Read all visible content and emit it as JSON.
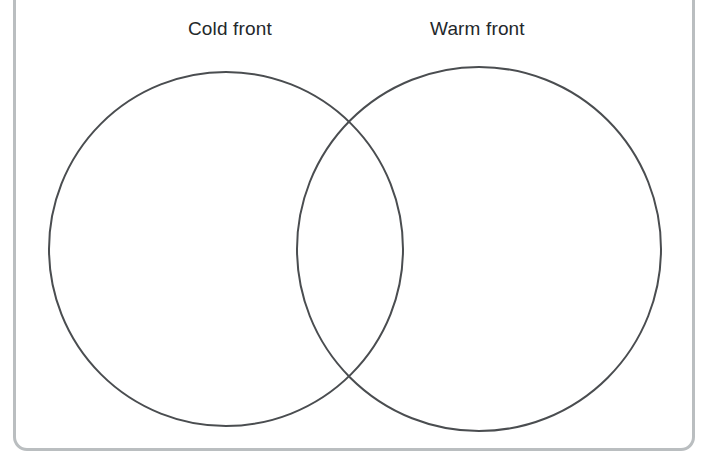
{
  "page": {
    "background_color": "#ffffff",
    "width": 710,
    "height": 469
  },
  "frame": {
    "name": "worksheet-border",
    "color": "#babec0",
    "stroke_width": 3,
    "corner_radius": 14,
    "note": "rounded rectangle border, top edge cropped above image"
  },
  "diagram": {
    "type": "venn",
    "set_count": 2,
    "fill": "none",
    "stroke_color": "#4a4d50",
    "stroke_width": 2,
    "circles": [
      {
        "id": "left",
        "label": "Cold front",
        "cx": 226,
        "cy": 249,
        "r": 177
      },
      {
        "id": "right",
        "label": "Warm front",
        "cx": 479,
        "cy": 249,
        "r": 182
      }
    ],
    "intersection_points": [
      {
        "x": 355,
        "y": 110
      },
      {
        "x": 355,
        "y": 395
      }
    ],
    "labels": {
      "left": "Cold front",
      "right": "Warm front",
      "color": "#24282b"
    }
  }
}
